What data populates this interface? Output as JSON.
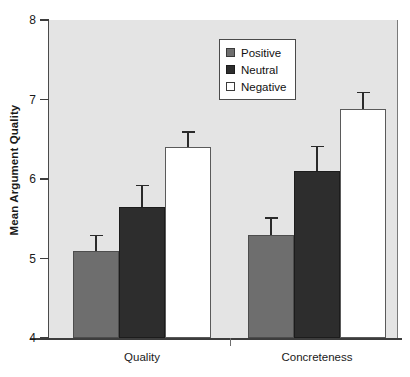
{
  "chart_data": {
    "type": "bar",
    "title": "",
    "subtitle": "",
    "xlabel": "",
    "ylabel": "Mean Argument Quality",
    "categories": [
      "Quality",
      "Concreteness"
    ],
    "ylim": [
      4,
      8
    ],
    "yticks": [
      "4",
      "5",
      "6",
      "7",
      "8"
    ],
    "grid": false,
    "legend_position": "top-center-right inside plot",
    "series": [
      {
        "name": "Positive",
        "color": "#6e6e6e",
        "values": [
          5.1,
          5.3
        ],
        "errors": [
          0.2,
          0.22
        ]
      },
      {
        "name": "Neutral",
        "color": "#2d2d2d",
        "values": [
          5.65,
          6.1
        ],
        "errors": [
          0.28,
          0.32
        ]
      },
      {
        "name": "Negative",
        "color": "#ffffff",
        "values": [
          6.4,
          6.88
        ],
        "errors": [
          0.2,
          0.22
        ]
      }
    ],
    "annotations": []
  },
  "legend": {
    "entries": [
      {
        "label": "Positive",
        "swatch": "positive"
      },
      {
        "label": "Neutral",
        "swatch": "neutral"
      },
      {
        "label": "Negative",
        "swatch": "negative"
      }
    ]
  },
  "colors": {
    "plot_background": "#e4e4e4",
    "page_background": "#ffffff",
    "axis": "#3d3d3d",
    "text": "#1a1a1a",
    "error_bar": "#2a2a2a"
  }
}
